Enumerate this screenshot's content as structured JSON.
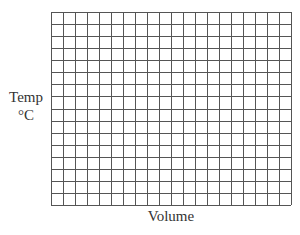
{
  "chart_data": {
    "type": "grid",
    "title": "",
    "xlabel": "Volume",
    "ylabel_line1": "Temp",
    "ylabel_line2": "°C",
    "columns": 20,
    "rows": 16,
    "series": [],
    "grid": true
  },
  "colors": {
    "grid_line": "#555555",
    "background": "#ffffff"
  }
}
